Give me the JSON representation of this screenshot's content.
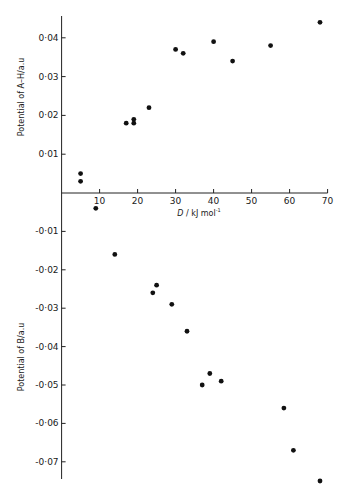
{
  "chart_data": {
    "type": "scatter",
    "title": "",
    "xlabel": "D / kJ mol⁻¹",
    "xlim": [
      0,
      70
    ],
    "x_ticks": [
      10,
      20,
      30,
      40,
      50,
      60,
      70
    ],
    "grid": false,
    "legend": null,
    "panels": [
      {
        "name": "Potential of A–H",
        "ylabel": "Potential of A–H/a.u",
        "ylim": [
          0,
          0.045
        ],
        "y_ticks": [
          0.01,
          0.02,
          0.03,
          0.04
        ],
        "y_tick_labels": [
          "0·01",
          "0·02",
          "0·03",
          "0·04"
        ],
        "points": [
          {
            "x": 5,
            "y": 0.005
          },
          {
            "x": 5,
            "y": 0.003
          },
          {
            "x": 17,
            "y": 0.018
          },
          {
            "x": 19,
            "y": 0.019
          },
          {
            "x": 19,
            "y": 0.018
          },
          {
            "x": 23,
            "y": 0.022
          },
          {
            "x": 30,
            "y": 0.037
          },
          {
            "x": 32,
            "y": 0.036
          },
          {
            "x": 40,
            "y": 0.039
          },
          {
            "x": 45,
            "y": 0.034
          },
          {
            "x": 55,
            "y": 0.038
          },
          {
            "x": 68,
            "y": 0.044
          }
        ]
      },
      {
        "name": "Potential of B",
        "ylabel": "Potential of B/a.u",
        "ylim": [
          -0.075,
          0
        ],
        "y_ticks": [
          -0.01,
          -0.02,
          -0.03,
          -0.04,
          -0.05,
          -0.06,
          -0.07
        ],
        "y_tick_labels": [
          "-0·01",
          "-0·02",
          "-0·03",
          "-0·04",
          "-0·05",
          "-0·06",
          "-0·07"
        ],
        "points": [
          {
            "x": 9,
            "y": -0.004
          },
          {
            "x": 14,
            "y": -0.016
          },
          {
            "x": 24,
            "y": -0.026
          },
          {
            "x": 25,
            "y": -0.024
          },
          {
            "x": 29,
            "y": -0.029
          },
          {
            "x": 33,
            "y": -0.036
          },
          {
            "x": 37,
            "y": -0.05
          },
          {
            "x": 39,
            "y": -0.047
          },
          {
            "x": 42,
            "y": -0.049
          },
          {
            "x": 58.5,
            "y": -0.056
          },
          {
            "x": 61,
            "y": -0.067
          },
          {
            "x": 68,
            "y": -0.075
          }
        ]
      }
    ]
  },
  "labels": {
    "x_axis": "kJ mol",
    "x_axis_var": "D",
    "x_axis_sep": " / ",
    "x_axis_exp": "-1",
    "y_top": "Potential of A–H/a.u",
    "y_bottom": "Potential of B/a.u"
  },
  "colors": {
    "axis": "#222222",
    "point": "#111111"
  }
}
